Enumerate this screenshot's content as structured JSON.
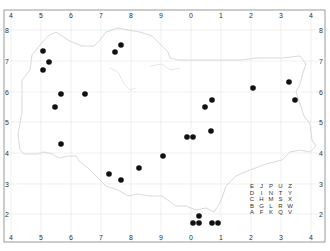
{
  "map": {
    "frame": {
      "left": 4,
      "top": 10,
      "right": 325,
      "bottom": 242,
      "stroke": "#999999"
    },
    "grid_color": "#e6e6e6",
    "outline_color": "#cfcfcf",
    "dot_color": "#111111",
    "x_ticks": [
      {
        "label": "4",
        "x": 11
      },
      {
        "label": "5",
        "x": 41
      },
      {
        "label": "6",
        "x": 71
      },
      {
        "label": "7",
        "x": 101
      },
      {
        "label": "8",
        "x": 131
      },
      {
        "label": "9",
        "x": 161
      },
      {
        "label": "0",
        "x": 191
      },
      {
        "label": "1",
        "x": 221
      },
      {
        "label": "2",
        "x": 251
      },
      {
        "label": "3",
        "x": 281
      },
      {
        "label": "4",
        "x": 311
      }
    ],
    "y_ticks": [
      {
        "label": "8",
        "y": 30
      },
      {
        "label": "7",
        "y": 61
      },
      {
        "label": "6",
        "y": 92
      },
      {
        "label": "5",
        "y": 122
      },
      {
        "label": "4",
        "y": 153
      },
      {
        "label": "3",
        "y": 184
      },
      {
        "label": "2",
        "y": 214
      }
    ],
    "dots": [
      {
        "x": 43,
        "y": 51
      },
      {
        "x": 49,
        "y": 62
      },
      {
        "x": 43,
        "y": 70
      },
      {
        "x": 115,
        "y": 52
      },
      {
        "x": 121,
        "y": 45
      },
      {
        "x": 61,
        "y": 94
      },
      {
        "x": 85,
        "y": 94
      },
      {
        "x": 55,
        "y": 107
      },
      {
        "x": 61,
        "y": 144
      },
      {
        "x": 212,
        "y": 100
      },
      {
        "x": 205,
        "y": 107
      },
      {
        "x": 211,
        "y": 131
      },
      {
        "x": 187,
        "y": 137
      },
      {
        "x": 193,
        "y": 137
      },
      {
        "x": 163,
        "y": 156
      },
      {
        "x": 253,
        "y": 88
      },
      {
        "x": 289,
        "y": 82
      },
      {
        "x": 295,
        "y": 100
      },
      {
        "x": 109,
        "y": 174
      },
      {
        "x": 121,
        "y": 180
      },
      {
        "x": 139,
        "y": 168
      },
      {
        "x": 199,
        "y": 216
      },
      {
        "x": 193,
        "y": 223
      },
      {
        "x": 199,
        "y": 223
      },
      {
        "x": 212,
        "y": 223
      },
      {
        "x": 218,
        "y": 223
      }
    ],
    "letter_grid": {
      "x": 252,
      "y": 188,
      "rows": [
        [
          "E",
          "J",
          "P",
          "U",
          "Z"
        ],
        [
          "D",
          "I",
          "N",
          "T",
          "Y"
        ],
        [
          "C",
          "H",
          "M",
          "S",
          "X"
        ],
        [
          "B",
          "G",
          "L",
          "R",
          "W"
        ],
        [
          "A",
          "F",
          "K",
          "Q",
          "V"
        ]
      ]
    }
  }
}
